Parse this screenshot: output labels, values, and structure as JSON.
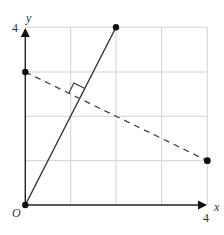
{
  "diagram": {
    "type": "coordinate-geometry",
    "grid": {
      "x_min": 0,
      "x_max": 4,
      "y_min": 0,
      "y_max": 4,
      "step": 1,
      "color": "#cfcfcf"
    },
    "axes": {
      "x_label": "x",
      "y_label": "y",
      "origin_label": "O",
      "x_tick_label": "4",
      "y_tick_label": "4",
      "color": "#222222"
    },
    "lines": [
      {
        "name": "solid-line",
        "from": [
          0,
          0
        ],
        "to": [
          2,
          4
        ],
        "style": "solid",
        "color": "#333333"
      },
      {
        "name": "dashed-line",
        "from": [
          0,
          3
        ],
        "to": [
          4,
          1
        ],
        "style": "dashed",
        "color": "#444444"
      }
    ],
    "points": [
      {
        "name": "origin",
        "coords": [
          0,
          0
        ]
      },
      {
        "name": "point-2-4",
        "coords": [
          2,
          4
        ]
      },
      {
        "name": "point-0-3",
        "coords": [
          0,
          3
        ]
      },
      {
        "name": "point-4-1",
        "coords": [
          4,
          1
        ]
      }
    ],
    "right_angle_marker": {
      "at": [
        1.2,
        2.4
      ]
    }
  }
}
